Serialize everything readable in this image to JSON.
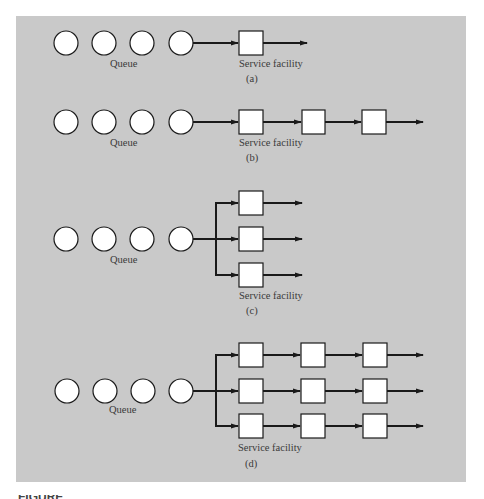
{
  "colors": {
    "panel_background": "#c9c9c9",
    "page_background": "#ffffff",
    "stroke": "#1a1a1a",
    "node_fill": "#ffffff",
    "text": "#3a3a3a"
  },
  "figures": [
    {
      "id": "a",
      "caption": "(a)",
      "queue_label": "Queue",
      "service_label": "Service facility",
      "description": "Single queue, single server, single phase",
      "queue_circles": 4,
      "channels": 1,
      "phases": 1
    },
    {
      "id": "b",
      "caption": "(b)",
      "queue_label": "Queue",
      "service_label": "Service facility",
      "description": "Single queue, single channel, multiple phases",
      "queue_circles": 4,
      "channels": 1,
      "phases": 3
    },
    {
      "id": "c",
      "caption": "(c)",
      "queue_label": "Queue",
      "service_label": "Service facility",
      "description": "Single queue, multiple channels, single phase",
      "queue_circles": 4,
      "channels": 3,
      "phases": 1
    },
    {
      "id": "d",
      "caption": "(d)",
      "queue_label": "Queue",
      "service_label": "Service facility",
      "description": "Single queue, multiple channels, multiple phases",
      "queue_circles": 4,
      "channels": 3,
      "phases": 3
    }
  ],
  "figure_caption_partial": "FIGURE"
}
